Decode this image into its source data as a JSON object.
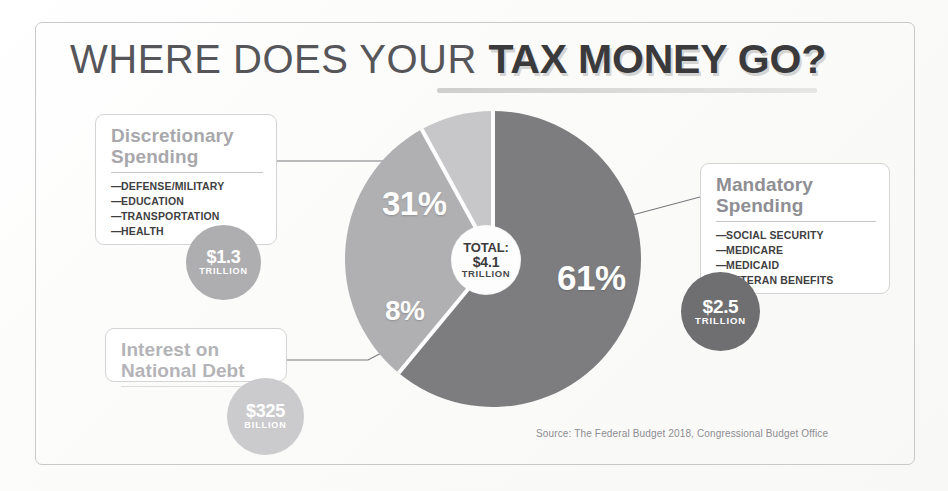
{
  "title": {
    "light_part": "WHERE DOES YOUR ",
    "bold_part": "TAX MONEY GO?"
  },
  "center": {
    "total_label": "TOTAL:",
    "amount": "$4.1",
    "unit": "TRILLION"
  },
  "callouts": {
    "discretionary": {
      "title": "Discretionary\nSpending",
      "title_line1": "Discretionary",
      "title_line2": "Spending",
      "items": [
        "DEFENSE/MILITARY",
        "EDUCATION",
        "TRANSPORTATION",
        "HEALTH"
      ],
      "amount_value": "$1.3",
      "amount_unit": "TRILLION",
      "color": "#aeaeb0"
    },
    "mandatory": {
      "title_line1": "Mandatory",
      "title_line2": "Spending",
      "items": [
        "SOCIAL SECURITY",
        "MEDICARE",
        "MEDICAID",
        "VETERAN BENEFITS"
      ],
      "amount_value": "$2.5",
      "amount_unit": "TRILLION",
      "color": "#6f6f72"
    },
    "interest": {
      "title_line1": "Interest on",
      "title_line2": "National Debt",
      "items": [],
      "amount_value": "$325",
      "amount_unit": "BILLION",
      "color": "#cbcbcd"
    }
  },
  "slice_labels": {
    "discretionary": "31%",
    "mandatory": "61%",
    "interest": "8%"
  },
  "source": "Source: The Federal Budget 2018, Congressional Budget Office",
  "chart_data": {
    "type": "pie",
    "title": "WHERE DOES YOUR TAX MONEY GO?",
    "total_label": "TOTAL: $4.1 TRILLION",
    "total_value": 4.1,
    "total_unit": "TRILLION",
    "categories": [
      "Mandatory Spending",
      "Discretionary Spending",
      "Interest on National Debt"
    ],
    "values": [
      61,
      31,
      8
    ],
    "value_unit": "percent",
    "amounts": [
      "$2.5 TRILLION",
      "$1.3 TRILLION",
      "$325 BILLION"
    ],
    "amounts_numeric_trillions": [
      2.5,
      1.3,
      0.325
    ],
    "colors": [
      "#7d7d80",
      "#b0b0b3",
      "#c7c7c9"
    ],
    "data_labels": [
      "61%",
      "31%",
      "8%"
    ],
    "start_angle_deg": 0,
    "direction": "clockwise",
    "donut": true,
    "donut_hole_ratio": 0.23,
    "legend": "callout-boxes",
    "grid": false,
    "source": "Source: The Federal Budget 2018, Congressional Budget Office"
  }
}
